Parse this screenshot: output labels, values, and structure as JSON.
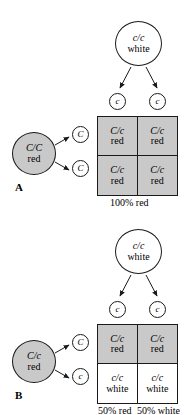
{
  "figure": {
    "type": "punnett-square-genetics-diagram",
    "panels": [
      {
        "id": "A",
        "letter": "A",
        "top_parent": {
          "genotype": "c/c",
          "phenotype": "white",
          "fill": "#ffffff"
        },
        "left_parent": {
          "genotype": "C/C",
          "phenotype": "red",
          "fill": "#c9c9c9"
        },
        "top_gametes": [
          "c",
          "c"
        ],
        "left_gametes": [
          "C",
          "C"
        ],
        "cells": [
          {
            "genotype": "C/c",
            "phenotype": "red",
            "shaded": true
          },
          {
            "genotype": "C/c",
            "phenotype": "red",
            "shaded": true
          },
          {
            "genotype": "C/c",
            "phenotype": "red",
            "shaded": true
          },
          {
            "genotype": "C/c",
            "phenotype": "red",
            "shaded": true
          }
        ],
        "results": [
          "100% red"
        ]
      },
      {
        "id": "B",
        "letter": "B",
        "top_parent": {
          "genotype": "c/c",
          "phenotype": "white",
          "fill": "#ffffff"
        },
        "left_parent": {
          "genotype": "C/c",
          "phenotype": "red",
          "fill": "#c9c9c9"
        },
        "top_gametes": [
          "c",
          "c"
        ],
        "left_gametes": [
          "C",
          "c"
        ],
        "cells": [
          {
            "genotype": "C/c",
            "phenotype": "red",
            "shaded": true
          },
          {
            "genotype": "C/c",
            "phenotype": "red",
            "shaded": true
          },
          {
            "genotype": "c/c",
            "phenotype": "white",
            "shaded": false
          },
          {
            "genotype": "c/c",
            "phenotype": "white",
            "shaded": false
          }
        ],
        "results": [
          "50% red",
          "50% white"
        ]
      }
    ],
    "colors": {
      "shade_gray": "#c9c9c9",
      "line": "#1a1a1a",
      "background": "#ffffff"
    }
  }
}
